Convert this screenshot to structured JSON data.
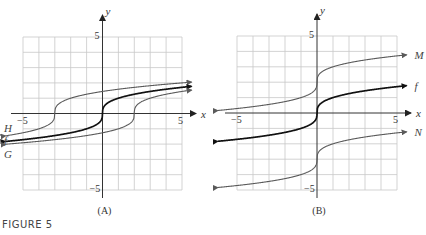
{
  "figure_label": "FIGURE 5",
  "chart_data": [
    {
      "type": "line",
      "panel": "(A)",
      "xlabel": "x",
      "ylabel": "y",
      "xlim": [
        -5,
        5
      ],
      "ylim": [
        -5,
        5
      ],
      "grid": true,
      "grid_step": 1,
      "tick_labels": {
        "x_min": "−5",
        "x_max": "5",
        "y_max": "5",
        "y_min": "−5"
      },
      "series": [
        {
          "name": "H",
          "formula": "cbrt(x + 3)",
          "shift_x": -3,
          "shift_y": 0,
          "x_range": [
            -6.1,
            5.6
          ],
          "color": "#5a5a5a",
          "bold": false,
          "label_side": "left"
        },
        {
          "name": "f",
          "formula": "cbrt(x)",
          "shift_x": 0,
          "shift_y": 0,
          "x_range": [
            -6.1,
            5.6
          ],
          "color": "#111111",
          "bold": true,
          "label_side": "left"
        },
        {
          "name": "G",
          "formula": "cbrt(x - 2)",
          "shift_x": 2,
          "shift_y": 0,
          "x_range": [
            -6.1,
            5.6
          ],
          "color": "#5a5a5a",
          "bold": false,
          "label_side": "left"
        }
      ]
    },
    {
      "type": "line",
      "panel": "(B)",
      "xlabel": "x",
      "ylabel": "y",
      "xlim": [
        -5,
        5
      ],
      "ylim": [
        -5,
        5
      ],
      "grid": true,
      "grid_step": 1,
      "tick_labels": {
        "x_min": "−5",
        "x_max": "5",
        "y_max": "5",
        "y_min": "−5"
      },
      "series": [
        {
          "name": "M",
          "formula": "cbrt(x) + 2",
          "shift_x": 0,
          "shift_y": 2,
          "x_range": [
            -6.2,
            5.6
          ],
          "color": "#5a5a5a",
          "bold": false,
          "label_side": "right"
        },
        {
          "name": "f",
          "formula": "cbrt(x)",
          "shift_x": 0,
          "shift_y": 0,
          "x_range": [
            -6.2,
            5.6
          ],
          "color": "#111111",
          "bold": true,
          "label_side": "right"
        },
        {
          "name": "N",
          "formula": "cbrt(x) - 3",
          "shift_x": 0,
          "shift_y": -3,
          "x_range": [
            -6.2,
            5.6
          ],
          "color": "#5a5a5a",
          "bold": false,
          "label_side": "right"
        }
      ]
    }
  ]
}
